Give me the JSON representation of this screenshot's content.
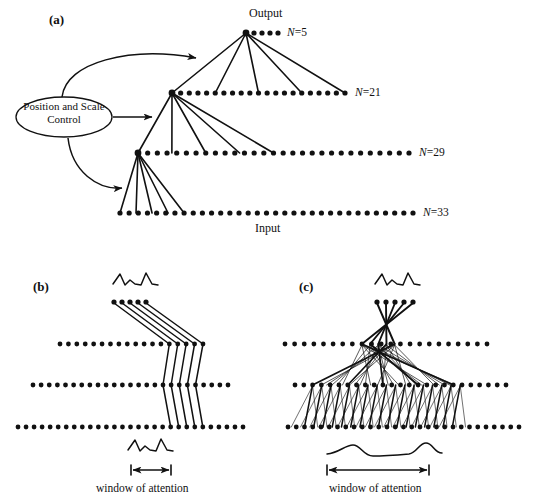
{
  "figure": {
    "background": "#ffffff",
    "ink": "#111111",
    "width": 534,
    "height": 501
  },
  "panel_a": {
    "letter": "(a)",
    "output_label": "Output",
    "input_label": "Input",
    "control_box": {
      "line1": "Position and Scale",
      "line2": "Control"
    },
    "layers": [
      {
        "name": "output-layer",
        "label": "N=5",
        "n_prefix": "N",
        "n_value": "=5",
        "count": 5,
        "x_start": 246,
        "x_end": 278,
        "y": 33,
        "label_x": 287
      },
      {
        "name": "layer-21",
        "label": "N=21",
        "n_prefix": "N",
        "n_value": "=21",
        "count": 21,
        "x_start": 172,
        "x_end": 345,
        "y": 93,
        "label_x": 355
      },
      {
        "name": "layer-29",
        "label": "N=29",
        "n_prefix": "N",
        "n_value": "=29",
        "count": 29,
        "x_start": 138,
        "x_end": 409,
        "y": 153,
        "label_x": 419
      },
      {
        "name": "layer-33",
        "label": "N=33",
        "n_prefix": "N",
        "n_value": "=33",
        "count": 33,
        "x_start": 120,
        "x_end": 413,
        "y": 213,
        "label_x": 423
      }
    ],
    "fan_nodes": [
      {
        "name": "output-node",
        "x": 246,
        "y": 33
      },
      {
        "name": "hidden-node-21",
        "x": 172,
        "y": 93
      },
      {
        "name": "hidden-node-29",
        "x": 138,
        "y": 153
      }
    ],
    "fan_fanout": 5
  },
  "panel_b": {
    "letter": "(b)",
    "window_label": "window of attention",
    "top_dots": {
      "count": 5,
      "x_start": 114,
      "spacing": 8,
      "y": 302
    },
    "rows": [
      {
        "name": "row-upper",
        "count": 18,
        "x_start": 60,
        "x_end": 203,
        "y": 344
      },
      {
        "name": "row-middle",
        "count": 25,
        "x_start": 33,
        "x_end": 228,
        "y": 385
      },
      {
        "name": "row-lower",
        "count": 29,
        "x_start": 18,
        "x_end": 243,
        "y": 427
      }
    ],
    "window_bar": {
      "x_left": 131,
      "x_right": 171,
      "y": 470
    },
    "label_pos": {
      "x": 96,
      "y": 483
    }
  },
  "panel_c": {
    "letter": "(c)",
    "window_label": "window of attention",
    "top_dots": {
      "count": 5,
      "x_start": 377,
      "spacing": 9,
      "y": 302
    },
    "rows": [
      {
        "name": "row-upper",
        "count": 22,
        "x_start": 285,
        "x_end": 487,
        "y": 344
      },
      {
        "name": "row-middle",
        "count": 25,
        "x_start": 295,
        "x_end": 506,
        "y": 385
      },
      {
        "name": "row-lower",
        "count": 29,
        "x_start": 288,
        "x_end": 519,
        "y": 427
      }
    ],
    "window_bar": {
      "x_left": 327,
      "x_right": 429,
      "y": 470
    },
    "label_pos": {
      "x": 329,
      "y": 483
    }
  }
}
